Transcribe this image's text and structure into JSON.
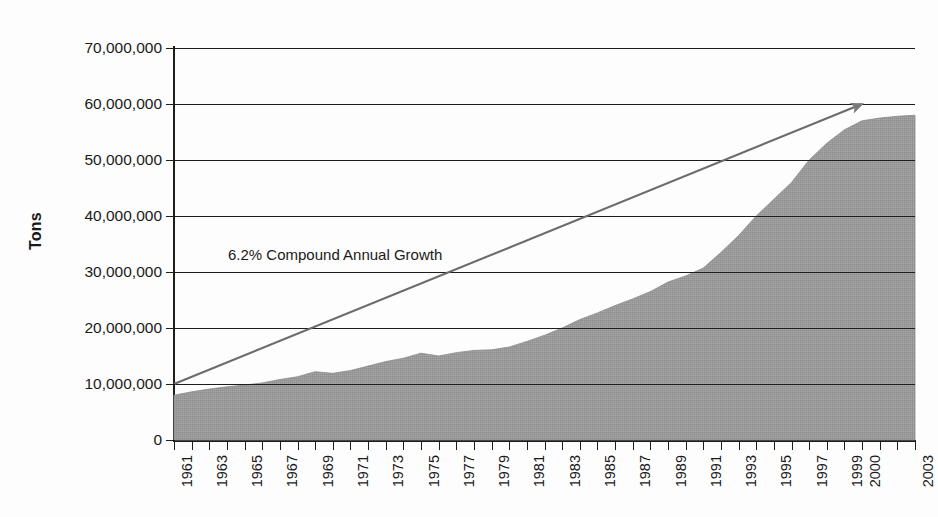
{
  "chart_data": {
    "type": "area",
    "title": "",
    "xlabel": "",
    "ylabel": "Tons",
    "ylim": [
      0,
      70000000
    ],
    "xlim": [
      1961,
      2003
    ],
    "grid": true,
    "legend": false,
    "ytick_labels": [
      "70,000,000",
      "60,000,000",
      "50,000,000",
      "40,000,000",
      "30,000,000",
      "20,000,000",
      "10,000,000",
      "0"
    ],
    "ytick_values": [
      70000000,
      60000000,
      50000000,
      40000000,
      30000000,
      20000000,
      10000000,
      0
    ],
    "xtick_labels": [
      "1961",
      "1963",
      "1965",
      "1967",
      "1969",
      "1971",
      "1973",
      "1975",
      "1977",
      "1979",
      "1981",
      "1983",
      "1985",
      "1987",
      "1989",
      "1991",
      "1993",
      "1995",
      "1997",
      "1999",
      "2000",
      "2003"
    ],
    "categories": [
      1961,
      1962,
      1963,
      1964,
      1965,
      1966,
      1967,
      1968,
      1969,
      1970,
      1971,
      1972,
      1973,
      1974,
      1975,
      1976,
      1977,
      1978,
      1979,
      1980,
      1981,
      1982,
      1983,
      1984,
      1985,
      1986,
      1987,
      1988,
      1989,
      1990,
      1991,
      1992,
      1993,
      1994,
      1995,
      1996,
      1997,
      1998,
      1999,
      2000,
      2001,
      2002,
      2003
    ],
    "values": [
      8000000,
      8600000,
      9100000,
      9500000,
      9800000,
      10200000,
      10800000,
      11300000,
      12200000,
      11900000,
      12400000,
      13200000,
      14000000,
      14600000,
      15500000,
      15000000,
      15600000,
      16000000,
      16100000,
      16600000,
      17600000,
      18700000,
      20000000,
      21500000,
      22700000,
      24000000,
      25200000,
      26500000,
      28200000,
      29300000,
      30700000,
      33500000,
      36500000,
      40000000,
      43000000,
      46000000,
      50000000,
      53000000,
      55400000,
      57000000,
      57500000,
      57800000,
      58000000
    ],
    "series_fill_color": "#999999",
    "series_name": "Tons",
    "annotations": [
      {
        "text": "6.2% Compound Annual Growth",
        "x": 1973,
        "y": 30000000
      }
    ],
    "trend_arrow": {
      "start": {
        "x": 1961,
        "y": 10000000
      },
      "end": {
        "x": 2000,
        "y": 60000000
      },
      "color": "#6b6b6b",
      "label": "6.2% Compound Annual Growth"
    }
  }
}
